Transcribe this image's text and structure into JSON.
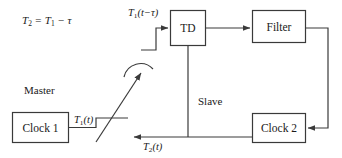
{
  "diagram": {
    "equation": {
      "full": "T2 = T1 - τ",
      "lhs_base": "T",
      "lhs_sub": "2",
      "operator_eq": "=",
      "rhs_base": "T",
      "rhs_sub": "1",
      "operator_minus": "−",
      "delay_symbol": "τ"
    },
    "blocks": [
      {
        "id": "td",
        "label": "TD"
      },
      {
        "id": "filter",
        "label": "Filter"
      },
      {
        "id": "clock1",
        "label": "Clock 1"
      },
      {
        "id": "clock2",
        "label": "Clock 2"
      }
    ],
    "side_labels": [
      {
        "id": "master",
        "label": "Master"
      },
      {
        "id": "slave",
        "label": "Slave"
      }
    ],
    "signals": [
      {
        "id": "t1-delayed",
        "base": "T",
        "sub": "1",
        "arg": "(t−τ)",
        "full": "T1(t−τ)"
      },
      {
        "id": "t1",
        "base": "T",
        "sub": "1",
        "arg": "(t)",
        "full": "T1(t)"
      },
      {
        "id": "t2",
        "base": "T",
        "sub": "2",
        "arg": "(t)",
        "full": "T2(t)"
      }
    ],
    "colors": {
      "stroke": "#3a3a3a",
      "text": "#1a1a1a",
      "background": "#ffffff"
    }
  }
}
